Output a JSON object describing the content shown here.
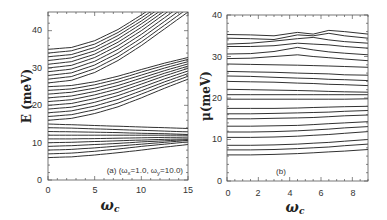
{
  "chart_data": [
    {
      "type": "line",
      "panel": "a",
      "title": "",
      "xlabel": "ωc",
      "ylabel": "E (meV)",
      "xlim": [
        0,
        15
      ],
      "ylim": [
        0,
        45
      ],
      "xticks": [
        0,
        5,
        10,
        15
      ],
      "yticks": [
        0,
        10,
        20,
        30,
        40
      ],
      "grid": false,
      "legend": null,
      "annotation": "(a) (ωx=1.0, ωy=10.0)",
      "x": [
        0,
        2.5,
        5,
        7.5,
        10,
        12.5,
        15
      ],
      "series_groups": [
        {
          "name": "lower band",
          "series": [
            {
              "values": [
                6.0,
                6.2,
                6.7,
                7.3,
                8.0,
                8.8,
                9.5
              ]
            },
            {
              "values": [
                7.0,
                7.2,
                7.7,
                8.3,
                9.0,
                9.6,
                10.2
              ]
            },
            {
              "values": [
                8.0,
                8.2,
                8.6,
                9.1,
                9.6,
                10.1,
                10.6
              ]
            },
            {
              "values": [
                9.0,
                9.2,
                9.5,
                9.8,
                10.2,
                10.5,
                10.8
              ]
            },
            {
              "values": [
                10.0,
                10.1,
                10.3,
                10.5,
                10.7,
                10.9,
                11.0
              ]
            },
            {
              "values": [
                11.0,
                11.0,
                11.1,
                11.2,
                11.3,
                11.4,
                11.5
              ]
            },
            {
              "values": [
                12.0,
                12.0,
                12.0,
                12.0,
                12.0,
                12.0,
                12.0
              ]
            },
            {
              "values": [
                13.0,
                12.9,
                12.8,
                12.7,
                12.5,
                12.4,
                12.2
              ]
            },
            {
              "values": [
                14.0,
                13.9,
                13.7,
                13.5,
                13.3,
                13.1,
                12.9
              ]
            },
            {
              "values": [
                15.0,
                14.8,
                14.6,
                14.4,
                14.2,
                14.0,
                13.8
              ]
            }
          ]
        },
        {
          "name": "middle band",
          "series": [
            {
              "values": [
                16.0,
                16.5,
                17.8,
                19.6,
                22.0,
                24.6,
                27.0
              ]
            },
            {
              "values": [
                17.0,
                17.5,
                18.8,
                20.6,
                23.0,
                25.5,
                27.8
              ]
            },
            {
              "values": [
                18.0,
                18.5,
                19.8,
                21.6,
                23.9,
                26.3,
                28.5
              ]
            },
            {
              "values": [
                19.0,
                19.5,
                20.8,
                22.6,
                24.8,
                27.1,
                29.2
              ]
            },
            {
              "values": [
                20.0,
                20.5,
                21.8,
                23.5,
                25.7,
                27.9,
                29.9
              ]
            },
            {
              "values": [
                21.0,
                21.5,
                22.8,
                24.4,
                26.5,
                28.6,
                30.5
              ]
            },
            {
              "values": [
                22.0,
                22.5,
                23.7,
                25.3,
                27.3,
                29.3,
                31.1
              ]
            },
            {
              "values": [
                23.0,
                23.5,
                24.6,
                26.2,
                28.1,
                30.0,
                31.7
              ]
            },
            {
              "values": [
                24.0,
                24.4,
                25.5,
                27.0,
                28.9,
                30.7,
                32.3
              ]
            },
            {
              "values": [
                25.0,
                25.3,
                26.3,
                27.8,
                29.6,
                31.3,
                32.8
              ]
            }
          ]
        },
        {
          "name": "upper band",
          "series": [
            {
              "values": [
                26.0,
                26.7,
                28.8,
                32.0,
                36.0,
                40.5,
                45.0
              ]
            },
            {
              "values": [
                27.0,
                27.7,
                29.8,
                33.0,
                37.0,
                41.5,
                46.0
              ]
            },
            {
              "values": [
                28.0,
                28.7,
                30.8,
                34.0,
                38.0,
                42.5,
                47.0
              ]
            },
            {
              "values": [
                29.0,
                29.7,
                31.8,
                35.0,
                39.0,
                43.5,
                48.0
              ]
            },
            {
              "values": [
                30.0,
                30.7,
                32.8,
                36.0,
                40.0,
                44.5,
                49.0
              ]
            },
            {
              "values": [
                31.0,
                31.7,
                33.7,
                36.9,
                40.9,
                45.3,
                49.8
              ]
            },
            {
              "values": [
                32.0,
                32.7,
                34.6,
                37.8,
                41.8,
                46.1,
                50.6
              ]
            },
            {
              "values": [
                33.0,
                33.6,
                35.5,
                38.7,
                42.6,
                46.9,
                51.4
              ]
            },
            {
              "values": [
                34.0,
                34.6,
                36.4,
                39.5,
                43.4,
                47.7,
                52.2
              ]
            },
            {
              "values": [
                35.0,
                35.5,
                37.3,
                40.3,
                44.2,
                48.5,
                53.0
              ]
            }
          ]
        }
      ]
    },
    {
      "type": "line",
      "panel": "b",
      "title": "",
      "xlabel": "ωc",
      "ylabel": "μ(meV)",
      "xlim": [
        0,
        9
      ],
      "ylim": [
        0,
        40
      ],
      "xticks": [
        0,
        2,
        4,
        6,
        8
      ],
      "yticks": [
        0,
        10,
        20,
        30,
        40
      ],
      "grid": false,
      "legend": null,
      "annotation": "(b)",
      "x": [
        0,
        1.5,
        3,
        4.5,
        5.5,
        6.5,
        7.5,
        9
      ],
      "series": [
        {
          "values": [
            6.3,
            6.3,
            6.4,
            6.6,
            6.8,
            7.0,
            7.2,
            7.6
          ]
        },
        {
          "values": [
            7.5,
            7.5,
            7.6,
            7.8,
            8.0,
            8.2,
            8.5,
            8.9
          ]
        },
        {
          "values": [
            8.6,
            8.6,
            8.7,
            8.9,
            9.1,
            9.3,
            9.6,
            10.0
          ]
        },
        {
          "values": [
            10.5,
            10.5,
            10.6,
            10.8,
            11.0,
            11.2,
            11.5,
            11.9
          ]
        },
        {
          "values": [
            11.8,
            11.8,
            11.9,
            12.1,
            12.3,
            12.5,
            12.8,
            13.1
          ]
        },
        {
          "values": [
            13.2,
            13.2,
            13.3,
            13.4,
            13.6,
            13.8,
            14.0,
            14.3
          ]
        },
        {
          "values": [
            15.0,
            15.0,
            15.1,
            15.2,
            15.3,
            15.5,
            15.7,
            15.9
          ]
        },
        {
          "values": [
            16.2,
            16.2,
            16.3,
            16.4,
            16.5,
            16.6,
            16.8,
            17.0
          ]
        },
        {
          "values": [
            17.5,
            17.5,
            17.5,
            17.6,
            17.7,
            17.8,
            17.9,
            18.0
          ]
        },
        {
          "values": [
            19.7,
            19.7,
            19.7,
            19.7,
            19.7,
            19.7,
            19.7,
            19.8
          ]
        },
        {
          "values": [
            20.8,
            20.8,
            20.8,
            20.8,
            20.8,
            20.8,
            20.8,
            20.8
          ]
        },
        {
          "values": [
            22.1,
            22.0,
            21.9,
            21.8,
            21.7,
            21.6,
            21.5,
            21.4
          ]
        },
        {
          "values": [
            24.0,
            23.9,
            23.8,
            23.6,
            23.5,
            23.3,
            23.2,
            23.0
          ]
        },
        {
          "values": [
            25.3,
            25.2,
            25.0,
            24.8,
            24.7,
            24.5,
            24.4,
            24.2
          ]
        },
        {
          "values": [
            26.4,
            26.3,
            26.2,
            26.0,
            25.9,
            25.8,
            25.6,
            25.5
          ]
        },
        {
          "values": [
            28.2,
            28.1,
            28.0,
            27.9,
            27.8,
            27.7,
            27.6,
            27.4
          ]
        },
        {
          "values": [
            29.5,
            29.6,
            30.0,
            30.4,
            30.0,
            29.7,
            29.4,
            29.0
          ]
        },
        {
          "values": [
            30.6,
            30.7,
            31.2,
            32.2,
            31.6,
            31.1,
            30.8,
            30.4
          ]
        },
        {
          "values": [
            32.4,
            32.4,
            32.6,
            33.2,
            33.0,
            32.8,
            32.4,
            32.0
          ]
        },
        {
          "values": [
            33.0,
            33.2,
            33.7,
            34.3,
            34.6,
            34.0,
            33.6,
            33.2
          ]
        },
        {
          "values": [
            34.4,
            34.3,
            34.1,
            35.2,
            35.0,
            35.6,
            35.0,
            34.4
          ]
        },
        {
          "values": [
            35.3,
            35.2,
            35.0,
            35.8,
            35.4,
            36.3,
            36.0,
            35.4
          ]
        }
      ]
    }
  ],
  "panels": {
    "a": {
      "ylabel": "E (meV)",
      "xlabel": "ωc",
      "xlabel_main": "ω",
      "xlabel_sub": "c",
      "annotation_prefix": "(a) (ω",
      "annotation_x_sub": "x",
      "annotation_mid": "=1.0,  ω",
      "annotation_y_sub": "y",
      "annotation_end": "=10.0)",
      "xtick_labels": [
        "0",
        "5",
        "10",
        "15"
      ],
      "ytick_labels": [
        "0",
        "10",
        "20",
        "30",
        "40"
      ]
    },
    "b": {
      "ylabel": "μ(meV)",
      "xlabel_main": "ω",
      "xlabel_sub": "c",
      "annotation": "(b)",
      "xtick_labels": [
        "0",
        "2",
        "4",
        "6",
        "8"
      ],
      "ytick_labels": [
        "0",
        "10",
        "20",
        "30",
        "40"
      ]
    }
  },
  "colors": {
    "line": "#1a1a1a",
    "axis": "#555555",
    "background": "#ffffff"
  }
}
